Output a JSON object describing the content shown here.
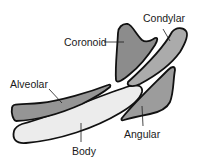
{
  "diagram": {
    "parts": [
      {
        "id": "coronoid",
        "label": "Coronoid",
        "fill": "#8c8c8c"
      },
      {
        "id": "condylar",
        "label": "Condylar",
        "fill": "#ababab"
      },
      {
        "id": "alveolar",
        "label": "Alveolar",
        "fill": "#959595"
      },
      {
        "id": "angular",
        "label": "Angular",
        "fill": "#9c9c9c"
      },
      {
        "id": "body",
        "label": "Body",
        "fill": "#ececec"
      }
    ]
  }
}
